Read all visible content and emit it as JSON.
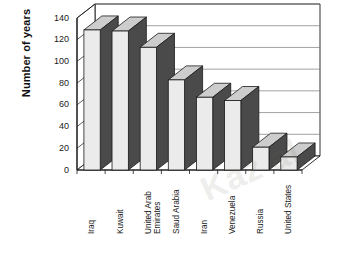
{
  "chart_data": {
    "type": "bar",
    "title": "",
    "subtitle": "",
    "xlabel": "",
    "ylabel": "Number of years",
    "ylim": [
      0,
      140
    ],
    "ytick_step": 20,
    "yticks": [
      0,
      20,
      40,
      60,
      80,
      100,
      120,
      140
    ],
    "grid": true,
    "legend": null,
    "style": "3d-bar",
    "categories": [
      "Iraq",
      "Kuwait",
      "United Arab\nEmirates",
      "Saud Arabia",
      "Iran",
      "Venezuela",
      "Russia",
      "United States"
    ],
    "values": [
      129,
      128,
      113,
      83,
      67,
      64,
      21,
      12
    ]
  },
  "axis": {
    "y_title": "Number of years",
    "y_tick_labels": [
      "140",
      "120",
      "100",
      "80",
      "60",
      "40",
      "20",
      "0"
    ]
  },
  "colors": {
    "bar_face": "#ebebeb",
    "bar_side": "#4a4a4a",
    "bar_top": "#cdcdcd",
    "bar_outline": "#1a1a1a",
    "grid": "#7a7a7a",
    "axis": "#1a1a1a",
    "background": "#ffffff",
    "watermark": "#6b6b60"
  },
  "watermark": {
    "text": "Kaz al"
  }
}
